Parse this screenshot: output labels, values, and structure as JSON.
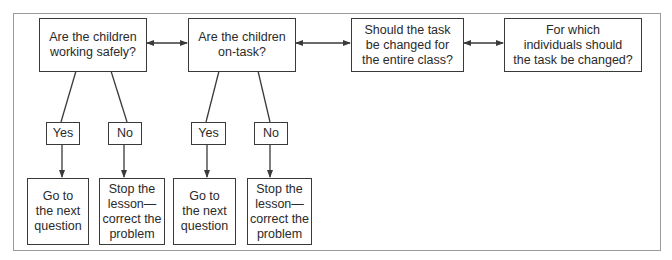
{
  "diagram": {
    "type": "flowchart",
    "questions": [
      {
        "id": "q1",
        "label": "Are the children\nworking safely?"
      },
      {
        "id": "q2",
        "label": "Are the children\non-task?"
      },
      {
        "id": "q3",
        "label": "Should the task\nbe changed for\nthe entire class?"
      },
      {
        "id": "q4",
        "label": "For which\nindividuals should\nthe task be changed?"
      }
    ],
    "branches": [
      {
        "parent": "q1",
        "answers": [
          {
            "label": "Yes",
            "outcome": "Go to\nthe next\nquestion"
          },
          {
            "label": "No",
            "outcome": "Stop the\nlesson—\ncorrect the\nproblem"
          }
        ]
      },
      {
        "parent": "q2",
        "answers": [
          {
            "label": "Yes",
            "outcome": "Go to\nthe next\nquestion"
          },
          {
            "label": "No",
            "outcome": "Stop the\nlesson—\ncorrect the\nproblem"
          }
        ]
      }
    ],
    "connections": [
      {
        "from": "q1",
        "to": "q2",
        "type": "bidirectional-arrow"
      },
      {
        "from": "q2",
        "to": "q3",
        "type": "bidirectional-arrow"
      },
      {
        "from": "q3",
        "to": "q4",
        "type": "bidirectional-arrow"
      }
    ],
    "colors": {
      "stroke": "#3a3a3a",
      "frame": "#9a9a9a",
      "background": "#ffffff"
    }
  }
}
